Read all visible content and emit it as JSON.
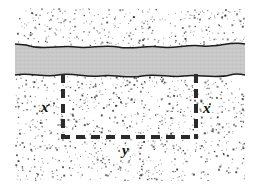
{
  "figure": {
    "canvas": {
      "width": 259,
      "height": 190,
      "background": "#ffffff"
    },
    "ground": {
      "name": "stippled-ground",
      "x": 15,
      "y": 8,
      "width": 230,
      "height": 173,
      "fill": "#ffffff",
      "stipple_color": "#3a3a3a",
      "stipple_dots": 1500
    },
    "stream": {
      "name": "stream-band",
      "label": "stream",
      "fill": "#c9c9c9",
      "edge_color": "#1c1c1c",
      "edge_width": 1.4,
      "top_edge_y": 44,
      "bottom_edge_y": 74,
      "left_x": 15,
      "right_x": 245
    },
    "fence": {
      "name": "dashed-fence",
      "color": "#2b2b2b",
      "stroke_width": 4,
      "dash_pattern": "9 6",
      "left_x": 63,
      "right_x": 196,
      "top_y": 75,
      "bottom_y": 137
    },
    "labels": {
      "x_left": "x",
      "x_right": "x",
      "y": "y"
    }
  },
  "chart_data": {
    "type": "diagram",
    "annotations": [
      {
        "text": "x",
        "role": "left-side-length",
        "x": 46,
        "y": 107
      },
      {
        "text": "x",
        "role": "right-side-length",
        "x": 208,
        "y": 108
      },
      {
        "text": "y",
        "role": "bottom-side-length",
        "x": 128,
        "y": 150
      }
    ],
    "geometry": {
      "rectangle_sides_drawn": 3,
      "left_side_px": {
        "x": 63,
        "y1": 75,
        "y2": 137
      },
      "right_side_px": {
        "x": 196,
        "y1": 75,
        "y2": 137
      },
      "bottom_side_px": {
        "y": 137,
        "x1": 63,
        "x2": 196
      },
      "stream_band_px": {
        "y1": 44,
        "y2": 74
      }
    }
  }
}
